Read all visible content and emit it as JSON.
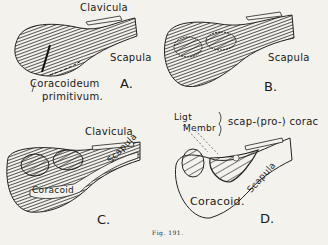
{
  "figure": {
    "caption": "Fig. 191.",
    "panels": [
      {
        "id": "A",
        "letter": "A.",
        "labels": {
          "clavicula": "Clavicula",
          "scapula": "Scapula",
          "coracoid_line1": "Coracoideum",
          "coracoid_line2": "primitivum."
        }
      },
      {
        "id": "B",
        "letter": "B.",
        "labels": {
          "scapula": "Scapula"
        }
      },
      {
        "id": "C",
        "letter": "C.",
        "labels": {
          "clavicula": "Clavicula",
          "scapula": "Scapula",
          "coracoid": "Coracoid"
        }
      },
      {
        "id": "D",
        "letter": "D.",
        "labels": {
          "ligt": "Ligt",
          "membr": "Membr",
          "brace_label": "scap-(pro-) corac",
          "scapula": "Scapula",
          "coracoid": "Coracoid."
        }
      }
    ]
  }
}
